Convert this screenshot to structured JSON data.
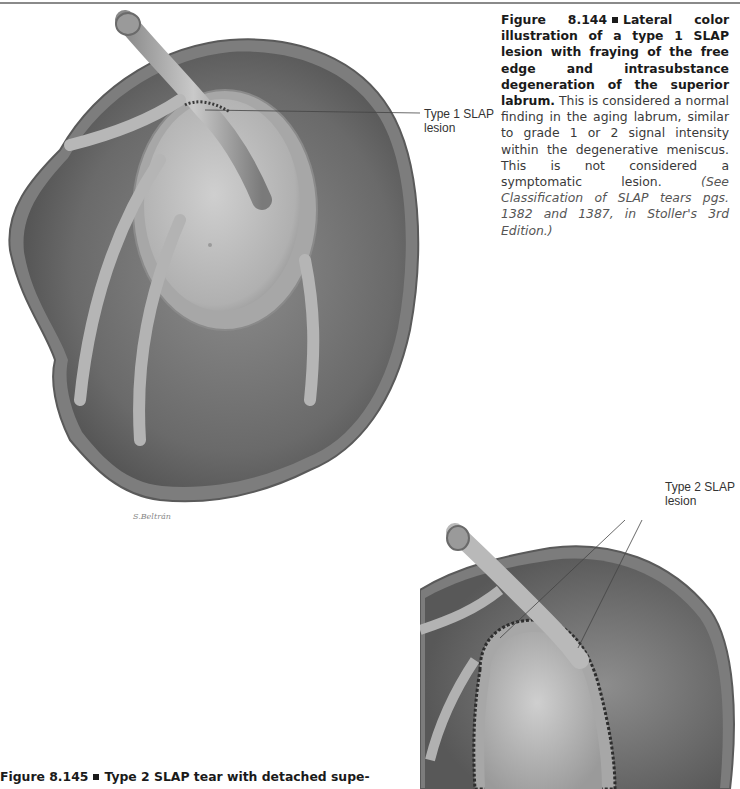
{
  "page": {
    "background": "#ffffff",
    "rule_color": "#8a8a8a"
  },
  "figure_144": {
    "label": "Figure 8.144",
    "lead": "Lateral color illustration of a type 1 SLAP lesion with fraying of the free edge and intrasubstance degeneration of the superior labrum.",
    "body": "This is considered a normal finding in the aging labrum, similar to grade 1 or 2 signal intensity within the degenerative meniscus. This is not considered a symptomatic lesion.",
    "reference": "(See Classification of SLAP tears pgs. 1382 and 1387, in Stoller's 3rd Edition.)",
    "callout_line1": "Type 1 SLAP",
    "callout_line2": "lesion",
    "signature": "S.Beltrán"
  },
  "figure_145": {
    "label": "Figure 8.145",
    "lead": "Type 2 SLAP tear with detached supe-",
    "callout_line1": "Type 2 SLAP",
    "callout_line2": "lesion"
  }
}
